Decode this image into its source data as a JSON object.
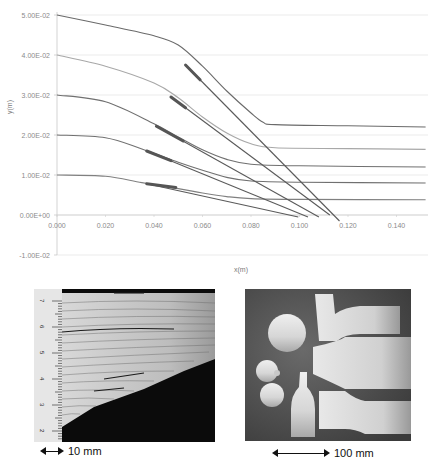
{
  "chart_data": {
    "type": "line",
    "title": "",
    "xlabel": "x(m)",
    "ylabel": "y(m)",
    "xlim": [
      0.0,
      0.155
    ],
    "ylim": [
      -0.01,
      0.05
    ],
    "grid": true,
    "x_ticks": [
      "0.000",
      "0.020",
      "0.040",
      "0.060",
      "0.080",
      "0.100",
      "0.120",
      "0.140"
    ],
    "y_ticks": [
      "5.00E-02",
      "4.00E-02",
      "3.00E-02",
      "2.00E-02",
      "1.00E-02",
      "0.00E+00",
      "-1.00E-02"
    ],
    "series": [
      {
        "name": "profile-0.05",
        "color": "#6a6a6a",
        "points": [
          [
            0,
            0.05
          ],
          [
            0.02,
            0.0475
          ],
          [
            0.04,
            0.0448
          ],
          [
            0.05,
            0.0425
          ],
          [
            0.06,
            0.0372
          ],
          [
            0.07,
            0.031
          ],
          [
            0.08,
            0.0255
          ],
          [
            0.085,
            0.0232
          ],
          [
            0.09,
            0.0226
          ],
          [
            0.12,
            0.0223
          ],
          [
            0.152,
            0.022
          ]
        ]
      },
      {
        "name": "profile-0.04",
        "color": "#a8a8a8",
        "points": [
          [
            0,
            0.04
          ],
          [
            0.02,
            0.0372
          ],
          [
            0.04,
            0.033
          ],
          [
            0.05,
            0.0293
          ],
          [
            0.06,
            0.0245
          ],
          [
            0.07,
            0.0205
          ],
          [
            0.08,
            0.0178
          ],
          [
            0.09,
            0.0168
          ],
          [
            0.12,
            0.0166
          ],
          [
            0.152,
            0.0164
          ]
        ]
      },
      {
        "name": "profile-0.03",
        "color": "#707070",
        "points": [
          [
            0,
            0.03
          ],
          [
            0.02,
            0.0283
          ],
          [
            0.04,
            0.0228
          ],
          [
            0.05,
            0.0195
          ],
          [
            0.06,
            0.0163
          ],
          [
            0.07,
            0.0139
          ],
          [
            0.08,
            0.0127
          ],
          [
            0.1,
            0.0123
          ],
          [
            0.152,
            0.012
          ]
        ]
      },
      {
        "name": "profile-0.02",
        "color": "#707070",
        "points": [
          [
            0,
            0.02
          ],
          [
            0.02,
            0.0193
          ],
          [
            0.035,
            0.0165
          ],
          [
            0.05,
            0.0132
          ],
          [
            0.06,
            0.0112
          ],
          [
            0.07,
            0.0094
          ],
          [
            0.08,
            0.0085
          ],
          [
            0.1,
            0.0082
          ],
          [
            0.152,
            0.008
          ]
        ]
      },
      {
        "name": "profile-0.01",
        "color": "#808080",
        "points": [
          [
            0,
            0.01
          ],
          [
            0.02,
            0.0097
          ],
          [
            0.035,
            0.0081
          ],
          [
            0.05,
            0.0066
          ],
          [
            0.06,
            0.0055
          ],
          [
            0.07,
            0.0046
          ],
          [
            0.08,
            0.0041
          ],
          [
            0.1,
            0.0039
          ],
          [
            0.152,
            0.0038
          ]
        ]
      }
    ],
    "tangent_lines": [
      {
        "name": "line-1",
        "from": [
          0.053,
          0.0375
        ],
        "to": [
          0.1165,
          -0.0015
        ],
        "thick_from": [
          0.053,
          0.0375
        ],
        "thick_to": [
          0.059,
          0.0338
        ]
      },
      {
        "name": "line-2",
        "from": [
          0.047,
          0.0295
        ],
        "to": [
          0.1125,
          0.0
        ],
        "thick_from": [
          0.047,
          0.0295
        ],
        "thick_to": [
          0.053,
          0.0268
        ]
      },
      {
        "name": "line-3",
        "from": [
          0.041,
          0.0222
        ],
        "to": [
          0.108,
          -0.0005
        ],
        "thick_from": [
          0.041,
          0.0222
        ],
        "thick_to": [
          0.052,
          0.0185
        ]
      },
      {
        "name": "line-4",
        "from": [
          0.037,
          0.016
        ],
        "to": [
          0.1035,
          -0.0005
        ],
        "thick_from": [
          0.037,
          0.016
        ],
        "thick_to": [
          0.047,
          0.0136
        ]
      },
      {
        "name": "line-5",
        "from": [
          0.037,
          0.0078
        ],
        "to": [
          0.0995,
          -0.0005
        ],
        "thick_from": [
          0.037,
          0.0078
        ],
        "thick_to": [
          0.049,
          0.0069
        ]
      }
    ]
  },
  "chart": {
    "xlabel": "x(m)",
    "ylabel": "y(m)",
    "x_ticks": [
      "0.000",
      "0.020",
      "0.040",
      "0.060",
      "0.080",
      "0.100",
      "0.120",
      "0.140"
    ],
    "y_ticks": [
      "5.00E-02",
      "4.00E-02",
      "3.00E-02",
      "2.00E-02",
      "1.00E-02",
      "0.00E+00",
      "-1.00E-02"
    ]
  },
  "photos": {
    "left": {
      "description": "cross-section of layered sheet material with mm ruler",
      "ruler_labels": [
        "7",
        "6",
        "5",
        "4",
        "3",
        "2"
      ],
      "scale_label": "10 mm"
    },
    "right": {
      "description": "spun metal parts: cones, bottles and caps",
      "scale_label": "100 mm"
    }
  }
}
